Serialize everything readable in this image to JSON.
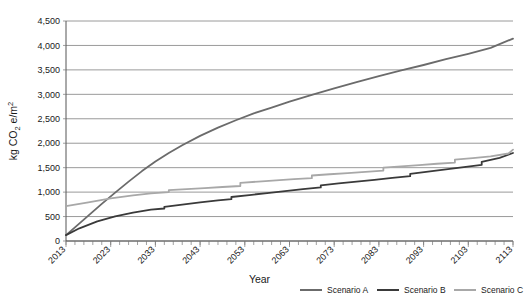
{
  "chart_data": {
    "type": "line",
    "title": "",
    "xlabel": "Year",
    "ylabel": "kg CO2 e/m2",
    "ylabel_parts": {
      "prefix": "kg CO",
      "sub": "2",
      "mid": " e/m",
      "sup": "2"
    },
    "xlim": [
      2013,
      2113
    ],
    "ylim": [
      0,
      4500
    ],
    "ytick_values": [
      0,
      500,
      1000,
      1500,
      2000,
      2500,
      3000,
      3500,
      4000,
      4500
    ],
    "ytick_labels": [
      "0",
      "500",
      "1,000",
      "1,500",
      "2,000",
      "2,500",
      "3,000",
      "3,500",
      "4,000",
      "4,500"
    ],
    "xtick_values": [
      2013,
      2023,
      2033,
      2043,
      2053,
      2063,
      2073,
      2083,
      2093,
      2103,
      2113
    ],
    "xtick_labels": [
      "2013",
      "2023",
      "2033",
      "2043",
      "2053",
      "2063",
      "2073",
      "2083",
      "2093",
      "2103",
      "2113"
    ],
    "xminor_step": 2,
    "grid": "horizontal",
    "legend_position": "bottom",
    "series": [
      {
        "name": "Scenario A",
        "color": "#6b6b6b",
        "width": 1.8,
        "x": [
          2013,
          2015,
          2018,
          2021,
          2024,
          2027,
          2030,
          2033,
          2036,
          2039,
          2043,
          2047,
          2051,
          2055,
          2059,
          2063,
          2068,
          2073,
          2078,
          2083,
          2088,
          2093,
          2098,
          2103,
          2108,
          2113
        ],
        "values": [
          120,
          280,
          520,
          760,
          990,
          1215,
          1430,
          1625,
          1800,
          1960,
          2150,
          2320,
          2470,
          2610,
          2730,
          2850,
          2990,
          3120,
          3250,
          3370,
          3490,
          3600,
          3720,
          3830,
          3950,
          4140
        ]
      },
      {
        "name": "Scenario B",
        "color": "#3a3a3a",
        "width": 1.8,
        "x": [
          2013,
          2016,
          2020,
          2024,
          2028,
          2032,
          2035,
          2035,
          2039,
          2043,
          2047,
          2050,
          2050,
          2054,
          2058,
          2062,
          2066,
          2070,
          2070,
          2074,
          2078,
          2082,
          2086,
          2090,
          2090,
          2094,
          2098,
          2102,
          2106,
          2106,
          2110,
          2113
        ],
        "values": [
          120,
          260,
          400,
          505,
          580,
          640,
          665,
          700,
          745,
          790,
          830,
          855,
          900,
          940,
          980,
          1020,
          1060,
          1095,
          1140,
          1180,
          1215,
          1250,
          1290,
          1325,
          1375,
          1420,
          1465,
          1510,
          1555,
          1620,
          1700,
          1800
        ]
      },
      {
        "name": "Scenario C",
        "color": "#a8a8a8",
        "width": 1.8,
        "x": [
          2013,
          2018,
          2023,
          2028,
          2032,
          2036,
          2036,
          2040,
          2044,
          2048,
          2052,
          2052,
          2056,
          2060,
          2064,
          2068,
          2068,
          2072,
          2076,
          2080,
          2084,
          2084,
          2088,
          2092,
          2096,
          2100,
          2100,
          2104,
          2108,
          2112,
          2113
        ],
        "values": [
          715,
          790,
          870,
          935,
          975,
          1000,
          1040,
          1060,
          1080,
          1105,
          1125,
          1190,
          1215,
          1240,
          1265,
          1285,
          1340,
          1365,
          1390,
          1415,
          1440,
          1500,
          1525,
          1550,
          1580,
          1605,
          1665,
          1695,
          1730,
          1790,
          1870
        ]
      }
    ]
  },
  "legend": {
    "items": [
      {
        "label": "Scenario A",
        "color": "#6b6b6b"
      },
      {
        "label": "Scenario B",
        "color": "#3a3a3a"
      },
      {
        "label": "Scenario C",
        "color": "#a8a8a8"
      }
    ]
  }
}
